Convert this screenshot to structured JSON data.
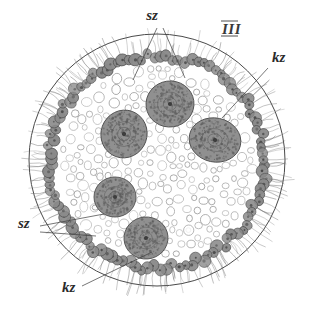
{
  "figure": {
    "name": "volvox-colony-cross-section",
    "plate_number": "III",
    "caption_labels": [
      {
        "id": "sz-top",
        "text": "sz",
        "x": 152,
        "y": 20,
        "role": "somatic-cell-label"
      },
      {
        "id": "kz-top-right",
        "text": "kz",
        "x": 272,
        "y": 62,
        "role": "gonidium-label"
      },
      {
        "id": "sz-bottom-left",
        "text": "sz",
        "x": 18,
        "y": 228,
        "role": "somatic-cell-label"
      },
      {
        "id": "kz-bottom-left",
        "text": "kz",
        "x": 62,
        "y": 292,
        "role": "gonidium-label"
      },
      {
        "id": "plate-numeral",
        "text": "III",
        "x": 222,
        "y": 34,
        "role": "plate-numeral"
      }
    ],
    "colors": {
      "ink": "#3b3b3b",
      "cell_fill": "#909090",
      "vacuole_stroke": "#8d8d8d",
      "envelope_stroke": "#4a4a4a",
      "background": "#ffffff"
    },
    "geometry": {
      "envelope": {
        "cx": 157,
        "cy": 160,
        "rx": 128,
        "ry": 126
      },
      "somatic_ring": {
        "cx": 157,
        "cy": 162,
        "rx": 108,
        "ry": 106
      },
      "matrix": {
        "cx": 157,
        "cy": 162,
        "rx": 100,
        "ry": 98
      }
    },
    "gonidia": [
      {
        "id": "gonidium-top",
        "cx": 170,
        "cy": 104,
        "rx": 24,
        "ry": 23,
        "rot": -8
      },
      {
        "id": "gonidium-right",
        "cx": 215,
        "cy": 140,
        "rx": 26,
        "ry": 22,
        "rot": 12
      },
      {
        "id": "gonidium-left",
        "cx": 124,
        "cy": 134,
        "rx": 23,
        "ry": 24,
        "rot": 20
      },
      {
        "id": "gonidium-lower-left",
        "cx": 115,
        "cy": 197,
        "rx": 21,
        "ry": 20,
        "rot": 0
      },
      {
        "id": "gonidium-bottom",
        "cx": 146,
        "cy": 238,
        "rx": 22,
        "ry": 21,
        "rot": -5
      }
    ],
    "leader_lines": [
      {
        "id": "leader-sz-left",
        "points": "157,28 133,80"
      },
      {
        "id": "leader-sz-right",
        "points": "163,28 185,78"
      },
      {
        "id": "leader-kz",
        "points": "268,68 222,118"
      },
      {
        "id": "leader-sz-bl-a",
        "points": "40,226 104,214"
      },
      {
        "id": "leader-sz-bl-b",
        "points": "40,232 96,236"
      },
      {
        "id": "leader-kz-bl",
        "points": "82,286 152,252"
      }
    ]
  }
}
